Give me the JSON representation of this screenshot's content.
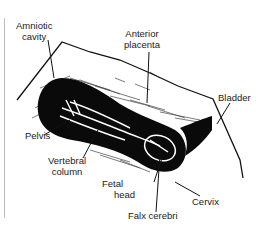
{
  "diagram": {
    "type": "ultrasound-sketch",
    "colors": {
      "ink": "#111111",
      "background": "#ffffff",
      "edge": "#bdbdbd"
    },
    "labels": [
      {
        "id": "amniotic-cavity",
        "line1": "Amniotic",
        "line2": "cavity"
      },
      {
        "id": "anterior-placenta",
        "line1": "Anterior",
        "line2": "placenta"
      },
      {
        "id": "bladder",
        "line1": "Bladder",
        "line2": ""
      },
      {
        "id": "pelvis",
        "line1": "Pelvis",
        "line2": ""
      },
      {
        "id": "vertebral-column",
        "line1": "Vertebral",
        "line2": "column"
      },
      {
        "id": "fetal-head",
        "line1": "Fetal",
        "line2": "head"
      },
      {
        "id": "cervix",
        "line1": "Cervix",
        "line2": ""
      },
      {
        "id": "falx-cerebri",
        "line1": "Falx cerebri",
        "line2": ""
      }
    ]
  }
}
